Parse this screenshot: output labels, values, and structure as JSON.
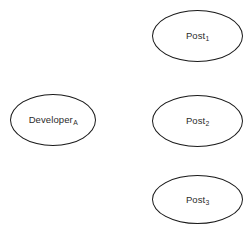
{
  "diagram": {
    "background_color": "#ffffff",
    "stroke_color": "#1a1a1a",
    "text_color": "#2b2b2b",
    "nodes": [
      {
        "id": "post-1",
        "base": "Post",
        "subscript": "1",
        "shape": "ellipse",
        "x": 152,
        "y": 10,
        "width": 91,
        "height": 52
      },
      {
        "id": "developer-a",
        "base": "Developer",
        "subscript": "A",
        "shape": "ellipse",
        "x": 10,
        "y": 94,
        "width": 86,
        "height": 52
      },
      {
        "id": "post-2",
        "base": "Post",
        "subscript": "2",
        "shape": "ellipse",
        "x": 152,
        "y": 95,
        "width": 91,
        "height": 52
      },
      {
        "id": "post-3",
        "base": "Post",
        "subscript": "3",
        "shape": "ellipse",
        "x": 152,
        "y": 175,
        "width": 91,
        "height": 49
      }
    ]
  }
}
